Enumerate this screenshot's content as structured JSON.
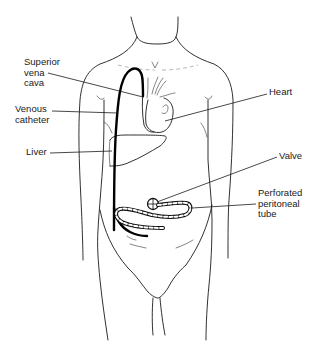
{
  "diagram": {
    "labels": [
      {
        "id": "superior-vena-cava",
        "text": "Superior\nvena\ncava"
      },
      {
        "id": "venous-catheter",
        "text": "Venous\ncatheter"
      },
      {
        "id": "liver",
        "text": "Liver"
      },
      {
        "id": "heart",
        "text": "Heart"
      },
      {
        "id": "valve",
        "text": "Valve"
      },
      {
        "id": "perforated-peritoneal-tube",
        "text": "Perforated\nperitoneal\ntube"
      }
    ],
    "structures": [
      "torso-outline",
      "neck",
      "arms",
      "heart",
      "liver",
      "superior-vena-cava",
      "venous-catheter",
      "valve",
      "perforated-peritoneal-tube",
      "pelvis",
      "legs"
    ],
    "colors": {
      "line": "#1a1a1a",
      "background": "#ffffff",
      "catheter": "#000000"
    }
  }
}
